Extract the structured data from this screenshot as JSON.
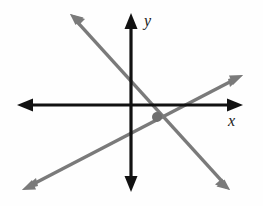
{
  "figure": {
    "kind": "coordinate-plane-two-lines",
    "background_color": "#fefefe",
    "axis_color": "#111111",
    "line_color": "#7a7a7a",
    "point_color": "#6e6e6e"
  },
  "labels": {
    "y_axis": "y",
    "x_axis": "x"
  },
  "chart_data": {
    "type": "line",
    "title": "",
    "xlabel": "x",
    "ylabel": "y",
    "grid": false,
    "legend": false,
    "axes": {
      "origin_px": [
        131,
        105
      ],
      "x_axis_from_px": [
        17,
        105
      ],
      "x_axis_to_px": [
        243,
        105
      ],
      "y_axis_from_px": [
        131,
        192
      ],
      "y_axis_to_px": [
        131,
        13
      ],
      "x_arrows": "both",
      "y_arrows": "both",
      "xlim": [
        -5,
        5
      ],
      "ylim": [
        -4,
        4
      ]
    },
    "series": [
      {
        "name": "line-negative-slope",
        "slope": -1.0,
        "color": "#7a7a7a",
        "arrows": "both",
        "from_px": [
          70,
          14
        ],
        "to_px": [
          230,
          190
        ]
      },
      {
        "name": "line-positive-slope",
        "slope": 0.52,
        "color": "#7a7a7a",
        "arrows": "both",
        "from_px": [
          22,
          190
        ],
        "to_px": [
          243,
          75
        ]
      }
    ],
    "annotations": [
      {
        "name": "intersection-point",
        "kind": "point",
        "center_px": [
          157,
          117
        ],
        "radius_px": 5,
        "color": "#6e6e6e",
        "label": ""
      }
    ]
  }
}
